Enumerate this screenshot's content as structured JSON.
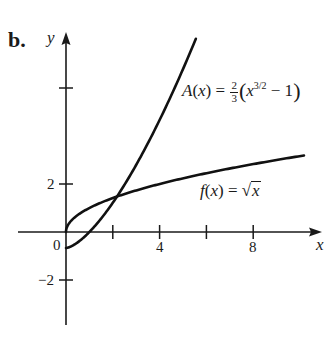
{
  "part_label": "b.",
  "chart_data": {
    "type": "line",
    "title": "",
    "xlabel": "x",
    "ylabel": "y",
    "xlim": [
      -2,
      11
    ],
    "ylim": [
      -4,
      8.4
    ],
    "grid": false,
    "x_ticks": [
      2,
      4,
      6,
      8
    ],
    "x_tick_labels": {
      "4": "4",
      "8": "8"
    },
    "y_ticks": [
      -2,
      2,
      6
    ],
    "y_tick_labels": {
      "-2": "−2",
      "2": "2"
    },
    "origin_label": "0",
    "series": [
      {
        "name": "A(x) = (2/3)(x^(3/2) - 1)",
        "label_parts": {
          "lhs": "A",
          "arg": "(x)",
          "eq": " = ",
          "num": "2",
          "den": "3",
          "base": "x",
          "exp": "3/2",
          "tail": " − 1"
        },
        "domain": [
          0,
          5.55
        ],
        "x": [
          0,
          0.5,
          1,
          1.5,
          2,
          2.18,
          3,
          4,
          5,
          5.55
        ],
        "y": [
          -0.667,
          -0.431,
          0,
          0.558,
          1.219,
          1.479,
          2.798,
          4.667,
          6.787,
          8.05
        ]
      },
      {
        "name": "f(x) = sqrt(x)",
        "label_parts": {
          "lhs": "f",
          "arg": "(x)",
          "eq": " = ",
          "radical": "√",
          "radicand": "x"
        },
        "domain": [
          0,
          10.17
        ],
        "x": [
          0,
          0.25,
          1,
          2,
          2.18,
          4,
          6,
          8,
          10.17
        ],
        "y": [
          0,
          0.5,
          1,
          1.414,
          1.476,
          2,
          2.449,
          2.828,
          3.189
        ]
      }
    ],
    "annotations": [
      {
        "text": "A(x) = ⅔(x^{3/2} − 1)",
        "near": "upper curve"
      },
      {
        "text": "f(x) = √x",
        "near": "lower curve"
      }
    ],
    "intersection": {
      "x": 2.18,
      "y": 1.48
    },
    "legend": "none (inline labels)"
  }
}
